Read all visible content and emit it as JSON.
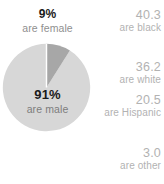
{
  "gender_chart": {
    "center_label": {
      "value": "91%",
      "label": "are male"
    },
    "callout_label": {
      "value": "9%",
      "label": "are female"
    },
    "colors": {
      "male_slice": "#d7d7d7",
      "female_slice": "#a7a7a7",
      "value_text": "#1a1a1a",
      "label_text": "#8f8f8f"
    }
  },
  "race_stats": {
    "color": "#b2b2b2",
    "items": [
      {
        "value": "40.3",
        "label": "are black"
      },
      {
        "value": "36.2",
        "label": "are white"
      },
      {
        "value": "20.5",
        "label": "are Hispanic"
      },
      {
        "value": "3.0",
        "label": "are other"
      }
    ]
  },
  "chart_data": {
    "type": "pie",
    "title": "",
    "categories": [
      "are male",
      "are female"
    ],
    "values": [
      91,
      9
    ],
    "value_labels": [
      "91%",
      "9%"
    ],
    "colors": [
      "#d7d7d7",
      "#a7a7a7"
    ],
    "units": "percent",
    "start_angle_deg": 0,
    "direction": "counterclockwise",
    "legend": "none",
    "grid": false,
    "side_table": {
      "type": "table",
      "categories": [
        "are black",
        "are white",
        "are Hispanic",
        "are other"
      ],
      "values": [
        40.3,
        36.2,
        20.5,
        3.0
      ],
      "units": "percent"
    }
  }
}
